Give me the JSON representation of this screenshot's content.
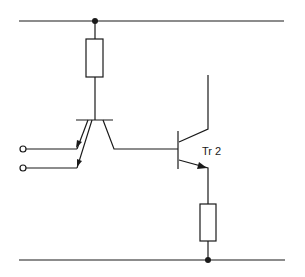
{
  "diagram": {
    "type": "circuit-schematic",
    "components": {
      "tr1": {
        "name": "phototransistor / dual-emitter transistor",
        "inputs": 2
      },
      "tr2": {
        "label": "Tr 2",
        "type": "NPN transistor"
      },
      "r1": {
        "name": "collector resistor",
        "position": "top"
      },
      "r2": {
        "name": "emitter resistor",
        "position": "bottom"
      }
    },
    "rails": [
      "top supply rail",
      "bottom ground rail"
    ],
    "inputs": [
      "input terminal 1",
      "input terminal 2"
    ]
  },
  "labels": {
    "tr2": "Tr 2"
  }
}
